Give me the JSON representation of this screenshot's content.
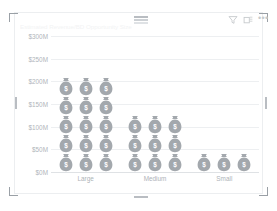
{
  "card": {
    "title": "Estimated Revenue/BD Opportunity Size"
  },
  "toolbar": {
    "filter_label": "Filter",
    "focus_label": "Focus mode",
    "more_label": "More options",
    "more_glyph": "•••",
    "icons": [
      "filter-icon",
      "focus-mode-icon",
      "more-options-icon"
    ]
  },
  "colors": {
    "pictogram": "#a3a8ad",
    "gridline": "#edeff1",
    "axis": "#dfe2e5",
    "axis_text": "#b0b5ba",
    "title_text": "#f2f3f4",
    "card_border": "#eceef0",
    "handle": "#9aa0a6"
  },
  "chart_data": {
    "type": "bar",
    "subtype": "pictograph",
    "title": "Estimated Revenue/BD Opportunity Size",
    "xlabel": "",
    "ylabel": "",
    "categories": [
      "Large",
      "Medium",
      "Small"
    ],
    "values": [
      215,
      125,
      35
    ],
    "value_unit": "$M",
    "icon": "money-bag-icon",
    "icon_value": 15,
    "icons_per_row": 3,
    "icon_rows": [
      5,
      3,
      1
    ],
    "icon_counts": [
      15,
      9,
      3
    ],
    "ylim": [
      0,
      300
    ],
    "yticks": [
      300,
      250,
      200,
      150,
      100,
      50,
      0
    ],
    "ytick_labels": [
      "$300M",
      "$250M",
      "$200M",
      "$150M",
      "$100M",
      "$50M",
      "$0M"
    ],
    "grid": true,
    "legend": false
  }
}
